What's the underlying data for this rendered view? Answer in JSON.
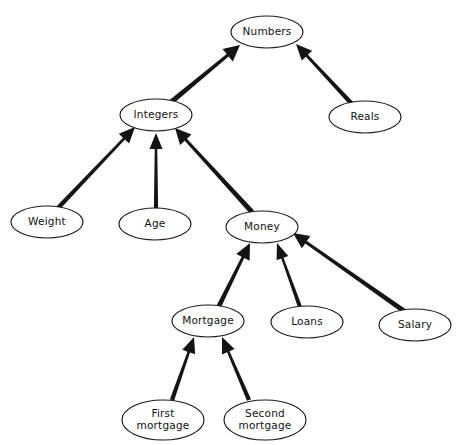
{
  "diagram": {
    "style": {
      "node_fill": "#ffffff",
      "node_stroke": "#1a1a1a",
      "edge_color": "#141414",
      "background": "#ffffff",
      "label_color": "#111111"
    },
    "nodes": [
      {
        "id": "numbers",
        "label": "Numbers",
        "label_lines": [
          "Numbers"
        ],
        "cx": 267,
        "cy": 32,
        "rx": 36,
        "ry": 16
      },
      {
        "id": "integers",
        "label": "Integers",
        "label_lines": [
          "Integers"
        ],
        "cx": 156,
        "cy": 115,
        "rx": 36,
        "ry": 16
      },
      {
        "id": "reals",
        "label": "Reals",
        "label_lines": [
          "Reals"
        ],
        "cx": 365,
        "cy": 117,
        "rx": 36,
        "ry": 16
      },
      {
        "id": "weight",
        "label": "Weight",
        "label_lines": [
          "Weight"
        ],
        "cx": 47,
        "cy": 222,
        "rx": 36,
        "ry": 16
      },
      {
        "id": "age",
        "label": "Age",
        "label_lines": [
          "Age"
        ],
        "cx": 155,
        "cy": 224,
        "rx": 36,
        "ry": 16
      },
      {
        "id": "money",
        "label": "Money",
        "label_lines": [
          "Money"
        ],
        "cx": 262,
        "cy": 227,
        "rx": 36,
        "ry": 16
      },
      {
        "id": "mortgage",
        "label": "Mortgage",
        "label_lines": [
          "Mortgage"
        ],
        "cx": 208,
        "cy": 321,
        "rx": 36,
        "ry": 16
      },
      {
        "id": "loans",
        "label": "Loans",
        "label_lines": [
          "Loans"
        ],
        "cx": 307,
        "cy": 322,
        "rx": 36,
        "ry": 16
      },
      {
        "id": "salary",
        "label": "Salary",
        "label_lines": [
          "Salary"
        ],
        "cx": 415,
        "cy": 325,
        "rx": 36,
        "ry": 16
      },
      {
        "id": "first",
        "label": "First mortgage",
        "label_lines": [
          "First",
          "mortgage"
        ],
        "cx": 163,
        "cy": 420,
        "rx": 41,
        "ry": 20
      },
      {
        "id": "second",
        "label": "Second mortgage",
        "label_lines": [
          "Second",
          "mortgage"
        ],
        "cx": 265,
        "cy": 420,
        "rx": 41,
        "ry": 20
      }
    ],
    "edges": [
      {
        "from": "integers",
        "to": "numbers",
        "x1": 170,
        "y1": 103,
        "x2": 240,
        "y2": 45,
        "w": 5.2
      },
      {
        "from": "reals",
        "to": "numbers",
        "x1": 352,
        "y1": 104,
        "x2": 296,
        "y2": 44,
        "w": 4.6
      },
      {
        "from": "weight",
        "to": "integers",
        "x1": 58,
        "y1": 208,
        "x2": 135,
        "y2": 127,
        "w": 4.6
      },
      {
        "from": "age",
        "to": "integers",
        "x1": 156,
        "y1": 208,
        "x2": 156,
        "y2": 133,
        "w": 4.2
      },
      {
        "from": "money",
        "to": "integers",
        "x1": 252,
        "y1": 212,
        "x2": 175,
        "y2": 128,
        "w": 5.0
      },
      {
        "from": "mortgage",
        "to": "money",
        "x1": 219,
        "y1": 306,
        "x2": 250,
        "y2": 243,
        "w": 4.8
      },
      {
        "from": "loans",
        "to": "money",
        "x1": 300,
        "y1": 307,
        "x2": 277,
        "y2": 243,
        "w": 4.0
      },
      {
        "from": "salary",
        "to": "money",
        "x1": 404,
        "y1": 311,
        "x2": 293,
        "y2": 233,
        "w": 4.8
      },
      {
        "from": "first",
        "to": "mortgage",
        "x1": 172,
        "y1": 400,
        "x2": 194,
        "y2": 337,
        "w": 4.4
      },
      {
        "from": "second",
        "to": "mortgage",
        "x1": 249,
        "y1": 400,
        "x2": 222,
        "y2": 337,
        "w": 4.4
      }
    ]
  }
}
